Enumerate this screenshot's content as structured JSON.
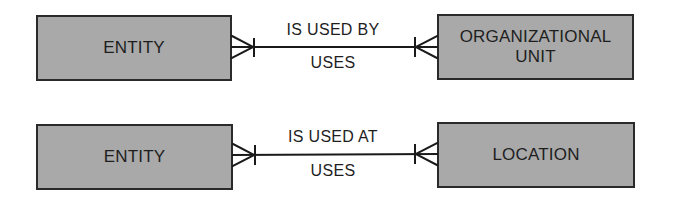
{
  "diagram": {
    "type": "entity-relationship",
    "relationships": [
      {
        "left_entity": "ENTITY",
        "right_entity": "ORGANIZATIONAL\nUNIT",
        "top_label": "IS USED BY",
        "bottom_label": "USES",
        "left_cardinality": "many",
        "right_cardinality": "many"
      },
      {
        "left_entity": "ENTITY",
        "right_entity": "LOCATION",
        "top_label": "IS USED AT",
        "bottom_label": "USES",
        "left_cardinality": "many",
        "right_cardinality": "many"
      }
    ],
    "colors": {
      "box_fill": "#a9a9a9",
      "box_border": "#2a2a2a",
      "line": "#1a1a1a",
      "background": "#ffffff"
    }
  }
}
